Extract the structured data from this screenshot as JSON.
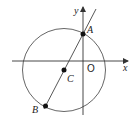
{
  "diagram": {
    "type": "coordinate-geometry",
    "axes": {
      "x_label": "x",
      "y_label": "y",
      "origin_label": "O"
    },
    "circle": {
      "center_label": "C"
    },
    "points": [
      {
        "label": "A",
        "on": "y-axis and circle"
      },
      {
        "label": "B",
        "on": "circle"
      },
      {
        "label": "C",
        "on": "circle center"
      }
    ],
    "line": {
      "through": [
        "A",
        "C",
        "B"
      ]
    },
    "colors": {
      "stroke": "#333333",
      "background": "#ffffff"
    }
  }
}
